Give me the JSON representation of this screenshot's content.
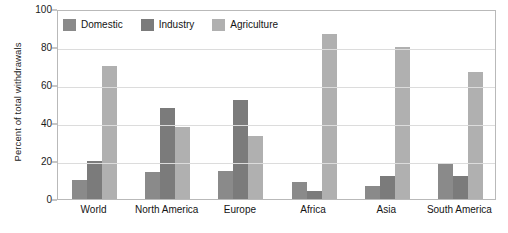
{
  "chart_data": {
    "type": "bar",
    "title": "",
    "xlabel": "",
    "ylabel": "Percent of total withdrawals",
    "ylim": [
      0,
      100
    ],
    "yticks": [
      0,
      20,
      40,
      60,
      80,
      100
    ],
    "grid": true,
    "legend_position": "top-left-inside",
    "categories": [
      "World",
      "North America",
      "Europe",
      "Africa",
      "Asia",
      "South America"
    ],
    "series": [
      {
        "name": "Domestic",
        "color": "#8a8a8a",
        "values": [
          10,
          14,
          15,
          9,
          7,
          19
        ]
      },
      {
        "name": "Industry",
        "color": "#7b7b7b",
        "values": [
          20,
          48,
          52,
          4,
          12,
          12
        ]
      },
      {
        "name": "Agriculture",
        "color": "#b0b0b0",
        "values": [
          70,
          38,
          33,
          87,
          80,
          67
        ]
      }
    ]
  },
  "axis": {
    "y_title": "Percent of total withdrawals",
    "y_tick_labels": [
      "100",
      "80",
      "60",
      "40",
      "20",
      "0"
    ]
  },
  "legend": {
    "entries": [
      {
        "label": "Domestic",
        "color": "#8a8a8a"
      },
      {
        "label": "Industry",
        "color": "#7b7b7b"
      },
      {
        "label": "Agriculture",
        "color": "#b0b0b0"
      }
    ]
  },
  "colors": {
    "frame": "#b9b9b9",
    "gridline": "#dcdcdc",
    "text": "#141414",
    "background": "#ffffff"
  }
}
